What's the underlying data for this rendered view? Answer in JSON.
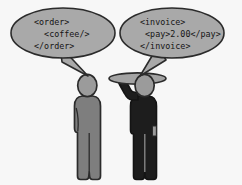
{
  "scene": {
    "title": "Order and invoice message exchange between two figures",
    "width": 242,
    "height": 185,
    "background_color": "#f7f7f7"
  },
  "colors": {
    "background": "#f7f7f7",
    "bubble_fill": "#a9a9a9",
    "outline": "#2b2b2b",
    "figure_light": "#7e7e7e",
    "figure_dark": "#1d1d1d",
    "head_fill": "#9b9b9b",
    "tray_fill": "#a3a3a3",
    "text": "#151515"
  },
  "bubbles": [
    {
      "id": "order-bubble",
      "speaker": "customer",
      "lines": [
        "<order>",
        "  <coffee/>",
        "</order>"
      ]
    },
    {
      "id": "invoice-bubble",
      "speaker": "waiter",
      "lines": [
        "<invoice>",
        " <pay>2.00</pay>",
        "</invoice>"
      ]
    }
  ],
  "figures": [
    {
      "id": "customer-figure",
      "label": "customer",
      "color": "#7e7e7e",
      "holding_tray": false
    },
    {
      "id": "waiter-figure",
      "label": "waiter",
      "color": "#1d1d1d",
      "holding_tray": true
    }
  ],
  "payment": {
    "amount": "2.00"
  }
}
